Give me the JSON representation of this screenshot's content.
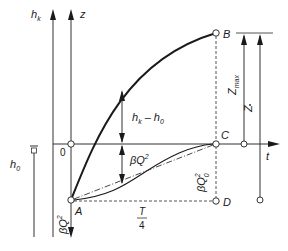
{
  "diagram": {
    "axes": {
      "hk_axis": "h",
      "hk_axis_sub": "k",
      "z_axis": "z",
      "t_axis": "t",
      "origin": "0"
    },
    "points": {
      "A": "A",
      "B": "B",
      "C": "C",
      "D": "D"
    },
    "labels": {
      "hk_minus_h0_main": "h",
      "hk_minus_h0_sub1": "k",
      "hk_minus_h0_minus": " – h",
      "hk_minus_h0_sub2": "0",
      "beta_q2": "βQ",
      "beta_q2_sup": "2",
      "beta_q0_2": "βQ",
      "beta_q0_2_sup": "2",
      "beta_q0_2_sub": "0",
      "beta_q2_axis": "βQ",
      "beta_q2_axis_sup": "2",
      "h0_main": "h",
      "h0_sub": "0",
      "z_max_main": "Z",
      "z_max_sub": "max",
      "z_bar": "Z",
      "t_over_4_num": "T",
      "t_over_4_den": "4"
    },
    "colors": {
      "line": "#1a1a1a",
      "thin": "#333333",
      "dashed": "#555555"
    }
  }
}
